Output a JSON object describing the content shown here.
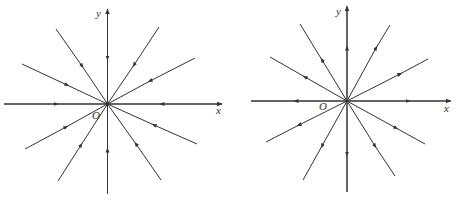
{
  "figures": [
    {
      "name": "converging-field",
      "origin_label": "O",
      "x_label": "x",
      "y_label": "y",
      "direction": "inward"
    },
    {
      "name": "diverging-field",
      "origin_label": "O",
      "x_label": "x",
      "y_label": "y",
      "direction": "outward"
    }
  ],
  "colors": {
    "line": "#333333",
    "background": "#ffffff"
  }
}
